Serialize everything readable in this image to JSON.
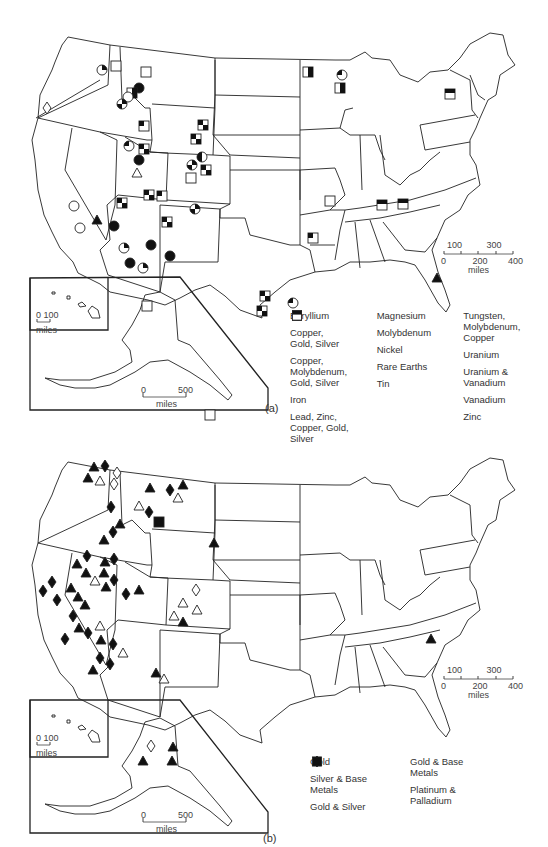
{
  "panel_a": {
    "caption": "(a)",
    "scale": {
      "top_ticks": [
        "100",
        "300"
      ],
      "bottom_ticks": [
        "0",
        "200",
        "400"
      ],
      "unit": "miles"
    },
    "hawaii_scale": {
      "ticks": "0 100",
      "unit": "miles"
    },
    "alaska_scale": {
      "ticks_left": "0",
      "ticks_right": "500",
      "unit": "miles"
    },
    "legend": [
      {
        "symbol": "triangle-open",
        "label": "Beryllium"
      },
      {
        "symbol": "circle-quarter",
        "label": "Copper,\n  Gold, Silver"
      },
      {
        "symbol": "circle-filled",
        "label": "Copper,\n  Molybdenum,\n  Gold, Silver"
      },
      {
        "symbol": "square-half-right",
        "label": "Iron"
      },
      {
        "symbol": "square-open-top",
        "label": "Lead, Zinc,\n  Copper, Gold,\n  Silver"
      },
      {
        "symbol": "circle-magnesium",
        "label": "Magnesium"
      },
      {
        "symbol": "circle-molybdenum",
        "label": "Molybdenum"
      },
      {
        "symbol": "diamond-open",
        "label": "Nickel"
      },
      {
        "symbol": "triangle-filled",
        "label": "Rare Earths"
      },
      {
        "symbol": "circle-half",
        "label": "Tin"
      },
      {
        "symbol": "circle-open",
        "label": "Tungsten,\n  Molybdenum,\n  Copper"
      },
      {
        "symbol": "square-checker",
        "label": "Uranium"
      },
      {
        "symbol": "square-uv",
        "label": "Uranium &\n  Vanadium"
      },
      {
        "symbol": "square-corner",
        "label": "Vanadium"
      },
      {
        "symbol": "square-top-bar",
        "label": "Zinc"
      }
    ],
    "markers": [
      {
        "t": "circle-quarter",
        "x": 102,
        "y": 70
      },
      {
        "t": "square-open-top",
        "x": 116,
        "y": 66
      },
      {
        "t": "diamond-open",
        "x": 47,
        "y": 108
      },
      {
        "t": "square-open-top",
        "x": 146,
        "y": 72
      },
      {
        "t": "circle-filled",
        "x": 139,
        "y": 88
      },
      {
        "t": "square-half-right",
        "x": 132,
        "y": 93
      },
      {
        "t": "circle-open",
        "x": 128,
        "y": 97
      },
      {
        "t": "circle-molybdenum",
        "x": 122,
        "y": 104
      },
      {
        "t": "square-uv",
        "x": 144,
        "y": 126
      },
      {
        "t": "square-checker",
        "x": 203,
        "y": 125
      },
      {
        "t": "square-checker",
        "x": 196,
        "y": 139
      },
      {
        "t": "circle-magnesium",
        "x": 129,
        "y": 146
      },
      {
        "t": "square-checker",
        "x": 144,
        "y": 149
      },
      {
        "t": "circle-filled",
        "x": 139,
        "y": 160
      },
      {
        "t": "triangle-open",
        "x": 137,
        "y": 173
      },
      {
        "t": "circle-half",
        "x": 202,
        "y": 157
      },
      {
        "t": "circle-molybdenum",
        "x": 192,
        "y": 165
      },
      {
        "t": "square-checker",
        "x": 206,
        "y": 170
      },
      {
        "t": "square-open-top",
        "x": 191,
        "y": 178
      },
      {
        "t": "square-checker",
        "x": 149,
        "y": 195
      },
      {
        "t": "square-uv",
        "x": 162,
        "y": 196
      },
      {
        "t": "square-checker",
        "x": 122,
        "y": 203
      },
      {
        "t": "circle-molybdenum",
        "x": 195,
        "y": 209
      },
      {
        "t": "square-checker",
        "x": 167,
        "y": 222
      },
      {
        "t": "circle-open",
        "x": 74,
        "y": 206
      },
      {
        "t": "triangle-filled",
        "x": 97,
        "y": 220
      },
      {
        "t": "circle-open",
        "x": 80,
        "y": 228
      },
      {
        "t": "circle-filled",
        "x": 114,
        "y": 226
      },
      {
        "t": "circle-filled",
        "x": 151,
        "y": 245
      },
      {
        "t": "circle-quarter",
        "x": 124,
        "y": 248
      },
      {
        "t": "circle-filled",
        "x": 170,
        "y": 256
      },
      {
        "t": "circle-filled",
        "x": 130,
        "y": 263
      },
      {
        "t": "circle-quarter",
        "x": 143,
        "y": 268
      },
      {
        "t": "square-half-right",
        "x": 308,
        "y": 72
      },
      {
        "t": "circle-magnesium",
        "x": 342,
        "y": 75
      },
      {
        "t": "square-half-right",
        "x": 340,
        "y": 88
      },
      {
        "t": "square-top-bar",
        "x": 450,
        "y": 94
      },
      {
        "t": "square-open-top",
        "x": 330,
        "y": 201
      },
      {
        "t": "square-top-bar",
        "x": 382,
        "y": 205
      },
      {
        "t": "square-top-bar",
        "x": 403,
        "y": 204
      },
      {
        "t": "square-uv",
        "x": 313,
        "y": 238
      },
      {
        "t": "triangle-filled",
        "x": 437,
        "y": 278
      },
      {
        "t": "square-checker",
        "x": 265,
        "y": 296
      },
      {
        "t": "square-checker",
        "x": 262,
        "y": 311
      },
      {
        "t": "circle-magnesium",
        "x": 293,
        "y": 303
      },
      {
        "t": "square-open-top",
        "x": 147,
        "y": 306
      },
      {
        "t": "square-open-top",
        "x": 210,
        "y": 415
      }
    ]
  },
  "panel_b": {
    "caption": "(b)",
    "scale": {
      "top_ticks": [
        "100",
        "300"
      ],
      "bottom_ticks": [
        "0",
        "200",
        "400"
      ],
      "unit": "miles"
    },
    "hawaii_scale": {
      "ticks": "0 100",
      "unit": "miles"
    },
    "alaska_scale": {
      "ticks_left": "0",
      "ticks_right": "500",
      "unit": "miles"
    },
    "legend": [
      {
        "symbol": "diamond-filled",
        "label": "Gold"
      },
      {
        "symbol": "diamond-open",
        "label": "Silver & Base\n  Metals"
      },
      {
        "symbol": "triangle-filled",
        "label": "Gold & Silver"
      },
      {
        "symbol": "triangle-open",
        "label": "Gold & Base\n  Metals"
      },
      {
        "symbol": "square-filled",
        "label": "Platinum &\n  Palladium"
      }
    ],
    "markers": [
      {
        "t": "triangle-filled",
        "x": 94,
        "y": 37
      },
      {
        "t": "diamond-filled",
        "x": 105,
        "y": 36
      },
      {
        "t": "triangle-filled",
        "x": 88,
        "y": 48
      },
      {
        "t": "triangle-open",
        "x": 100,
        "y": 51
      },
      {
        "t": "diamond-open",
        "x": 117,
        "y": 43
      },
      {
        "t": "diamond-open",
        "x": 114,
        "y": 54
      },
      {
        "t": "triangle-filled",
        "x": 150,
        "y": 58
      },
      {
        "t": "diamond-filled",
        "x": 170,
        "y": 60
      },
      {
        "t": "triangle-filled",
        "x": 183,
        "y": 55
      },
      {
        "t": "triangle-open",
        "x": 178,
        "y": 68
      },
      {
        "t": "triangle-open",
        "x": 139,
        "y": 76
      },
      {
        "t": "diamond-filled",
        "x": 111,
        "y": 77
      },
      {
        "t": "diamond-filled",
        "x": 149,
        "y": 82
      },
      {
        "t": "square-filled",
        "x": 159,
        "y": 92
      },
      {
        "t": "triangle-filled",
        "x": 120,
        "y": 94
      },
      {
        "t": "diamond-filled",
        "x": 113,
        "y": 102
      },
      {
        "t": "triangle-filled",
        "x": 104,
        "y": 110
      },
      {
        "t": "triangle-filled",
        "x": 214,
        "y": 113
      },
      {
        "t": "diamond-filled",
        "x": 87,
        "y": 126
      },
      {
        "t": "diamond-filled",
        "x": 114,
        "y": 129
      },
      {
        "t": "triangle-filled",
        "x": 77,
        "y": 134
      },
      {
        "t": "triangle-filled",
        "x": 105,
        "y": 132
      },
      {
        "t": "triangle-filled",
        "x": 86,
        "y": 143
      },
      {
        "t": "triangle-filled",
        "x": 104,
        "y": 143
      },
      {
        "t": "triangle-open",
        "x": 95,
        "y": 151
      },
      {
        "t": "diamond-filled",
        "x": 114,
        "y": 150
      },
      {
        "t": "triangle-filled",
        "x": 106,
        "y": 157
      },
      {
        "t": "diamond-filled",
        "x": 52,
        "y": 152
      },
      {
        "t": "diamond-filled",
        "x": 43,
        "y": 161
      },
      {
        "t": "triangle-filled",
        "x": 71,
        "y": 158
      },
      {
        "t": "diamond-filled",
        "x": 57,
        "y": 170
      },
      {
        "t": "triangle-filled",
        "x": 78,
        "y": 167
      },
      {
        "t": "triangle-filled",
        "x": 85,
        "y": 175
      },
      {
        "t": "diamond-filled",
        "x": 126,
        "y": 164
      },
      {
        "t": "triangle-filled",
        "x": 139,
        "y": 160
      },
      {
        "t": "diamond-open",
        "x": 196,
        "y": 160
      },
      {
        "t": "triangle-open",
        "x": 183,
        "y": 173
      },
      {
        "t": "triangle-open",
        "x": 197,
        "y": 180
      },
      {
        "t": "triangle-open",
        "x": 174,
        "y": 186
      },
      {
        "t": "triangle-filled",
        "x": 183,
        "y": 192
      },
      {
        "t": "diamond-filled",
        "x": 73,
        "y": 186
      },
      {
        "t": "triangle-filled",
        "x": 79,
        "y": 198
      },
      {
        "t": "triangle-open",
        "x": 100,
        "y": 196
      },
      {
        "t": "diamond-filled",
        "x": 88,
        "y": 203
      },
      {
        "t": "diamond-filled",
        "x": 65,
        "y": 209
      },
      {
        "t": "triangle-filled",
        "x": 101,
        "y": 210
      },
      {
        "t": "diamond-filled",
        "x": 113,
        "y": 214
      },
      {
        "t": "triangle-open",
        "x": 123,
        "y": 223
      },
      {
        "t": "diamond-filled",
        "x": 100,
        "y": 228
      },
      {
        "t": "diamond-filled",
        "x": 110,
        "y": 234
      },
      {
        "t": "triangle-filled",
        "x": 93,
        "y": 240
      },
      {
        "t": "triangle-filled",
        "x": 156,
        "y": 243
      },
      {
        "t": "triangle-open",
        "x": 164,
        "y": 249
      },
      {
        "t": "triangle-filled",
        "x": 431,
        "y": 209
      },
      {
        "t": "diamond-open",
        "x": 151,
        "y": 316
      },
      {
        "t": "triangle-filled",
        "x": 173,
        "y": 317
      },
      {
        "t": "triangle-filled",
        "x": 143,
        "y": 331
      },
      {
        "t": "triangle-filled",
        "x": 172,
        "y": 331
      }
    ]
  }
}
